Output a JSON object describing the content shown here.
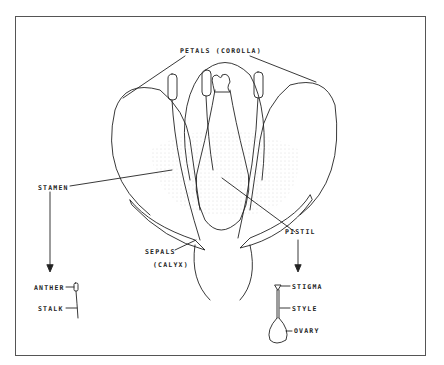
{
  "diagram": {
    "labels": {
      "petals": "PETALS (COROLLA)",
      "stamen": "STAMEN",
      "sepals": "SEPALS",
      "calyx": "(CALYX)",
      "pistil": "PISTIL",
      "anther": "ANTHER",
      "stalk": "STALK",
      "stigma": "STIGMA",
      "style": "STYLE",
      "ovary": "OVARY"
    },
    "colors": {
      "line": "#222222",
      "frame": "#555555",
      "stipple": "#cccccc"
    }
  }
}
